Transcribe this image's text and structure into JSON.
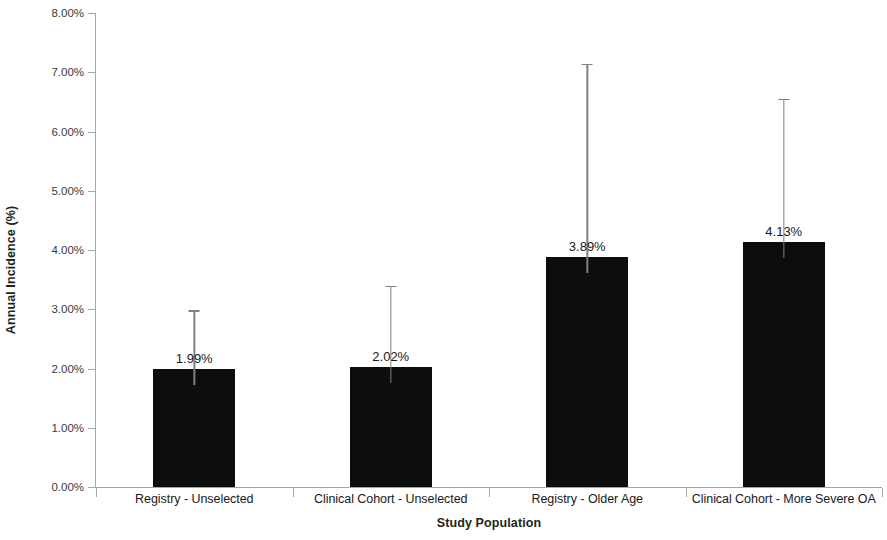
{
  "chart_data": {
    "type": "bar",
    "title": "",
    "xlabel": "Study Population",
    "ylabel": "Annual Incidence (%)",
    "categories": [
      "Registry - Unselected",
      "Clinical Cohort - Unselected",
      "Registry - Older Age",
      "Clinical Cohort - More Severe OA"
    ],
    "values": [
      1.99,
      2.02,
      3.89,
      4.13
    ],
    "value_labels": [
      "1.99%",
      "2.02%",
      "3.89%",
      "4.13%"
    ],
    "error_bars_upper": [
      2.98,
      3.39,
      7.14,
      6.55
    ],
    "ylim": [
      0,
      8
    ],
    "ytick_values": [
      0,
      1,
      2,
      3,
      4,
      5,
      6,
      7,
      8
    ],
    "ytick_labels": [
      "0.00%",
      "1.00%",
      "2.00%",
      "3.00%",
      "4.00%",
      "5.00%",
      "6.00%",
      "7.00%",
      "8.00%"
    ],
    "grid": false,
    "legend": false,
    "legend_position": "none",
    "bar_color": "#0d0d0d",
    "error_bar_color": "#808080",
    "axis_color": "#a6a6a6",
    "background_color": "#ffffff"
  }
}
